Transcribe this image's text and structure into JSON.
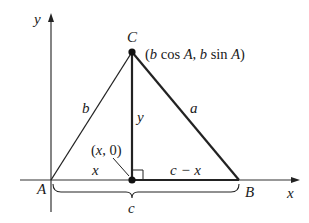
{
  "diagram": {
    "type": "coordinate-geometry",
    "axes": {
      "x_label": "x",
      "y_label": "y"
    },
    "vertices": {
      "A": {
        "label": "A"
      },
      "B": {
        "label": "B"
      },
      "C": {
        "label": "C",
        "coord_label": "(b cos A, b sin A)"
      }
    },
    "foot_point": {
      "label": "(x, 0)"
    },
    "side_labels": {
      "a": "a",
      "b": "b",
      "altitude": "y",
      "left_segment": "x",
      "right_segment": "c − x",
      "base_brace": "c"
    },
    "colors": {
      "stroke": "#1a1a1a",
      "axis": "#333333",
      "background": "#ffffff"
    }
  }
}
